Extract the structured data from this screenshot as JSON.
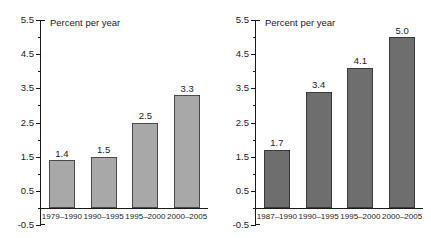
{
  "figure": {
    "background": "#ffffff",
    "axis_color": "#1a1a1a"
  },
  "chart_data": [
    {
      "type": "bar",
      "panel": "left",
      "title": "",
      "ylabel": "Percent per year",
      "xlabel": "",
      "categories": [
        "1979–1990",
        "1990–1995",
        "1995–2000",
        "2000–2005"
      ],
      "values": [
        1.4,
        1.5,
        2.5,
        3.3
      ],
      "value_labels": [
        "1.4",
        "1.5",
        "2.5",
        "3.3"
      ],
      "ylim": [
        -0.5,
        5.5
      ],
      "ytick_labels": [
        "5.5",
        "4.5",
        "3.5",
        "2.5",
        "1.5",
        "0.5",
        "-0.5"
      ],
      "ytick_values": [
        5.5,
        4.5,
        3.5,
        2.5,
        1.5,
        0.5,
        -0.5
      ],
      "minor_tick_values": [
        5.0,
        4.0,
        3.0,
        2.0,
        1.0,
        0.0
      ],
      "grid": false,
      "legend": null,
      "bar_fill": "#a8a8a8",
      "bar_edge": "#4a4a4a"
    },
    {
      "type": "bar",
      "panel": "right",
      "title": "",
      "ylabel": "Percent per year",
      "xlabel": "",
      "categories": [
        "1987–1990",
        "1990–1995",
        "1995–2000",
        "2000–2005"
      ],
      "values": [
        1.7,
        3.4,
        4.1,
        5.0
      ],
      "value_labels": [
        "1.7",
        "3.4",
        "4.1",
        "5.0"
      ],
      "ylim": [
        -0.5,
        5.5
      ],
      "ytick_labels": [
        "5.5",
        "4.5",
        "3.5",
        "2.5",
        "1.5",
        "0.5",
        "-0.5"
      ],
      "ytick_values": [
        5.5,
        4.5,
        3.5,
        2.5,
        1.5,
        0.5,
        -0.5
      ],
      "minor_tick_values": [
        5.0,
        4.0,
        3.0,
        2.0,
        1.0,
        0.0
      ],
      "grid": false,
      "legend": null,
      "bar_fill": "#6e6e6e",
      "bar_edge": "#3a3a3a"
    }
  ]
}
